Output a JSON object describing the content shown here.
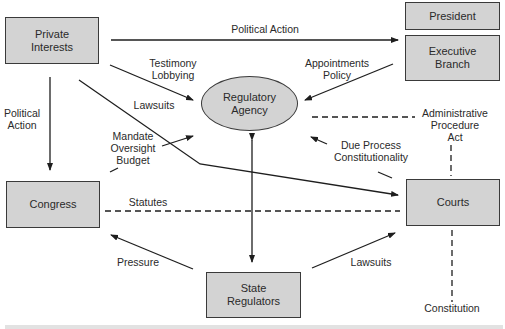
{
  "diagram": {
    "nodes": {
      "private_interests": "Private\nInterests",
      "president": "President",
      "executive_branch": "Executive\nBranch",
      "regulatory_agency": "Regulatory\nAgency",
      "congress": "Congress",
      "courts": "Courts",
      "state_regulators": "State\nRegulators"
    },
    "edge_labels": {
      "political_action_top": "Political Action",
      "testimony_lobbying": "Testimony\nLobbying",
      "appointments_policy": "Appointments\nPolicy",
      "lawsuits_private": "Lawsuits",
      "political_action_left": "Political\nAction",
      "mandate_oversight_budget": "Mandate\nOversight\nBudget",
      "administrative_procedure_act": "Administrative\nProcedure\nAct",
      "due_process_constitutionality": "Due Process\nConstitutionality",
      "statutes": "Statutes",
      "pressure": "Pressure",
      "lawsuits_state": "Lawsuits",
      "constitution": "Constitution"
    },
    "colors": {
      "node_fill": "#d3d3d3",
      "node_border": "#3a3a3a",
      "line": "#1e1e1e",
      "text": "#2a2a2a"
    }
  }
}
